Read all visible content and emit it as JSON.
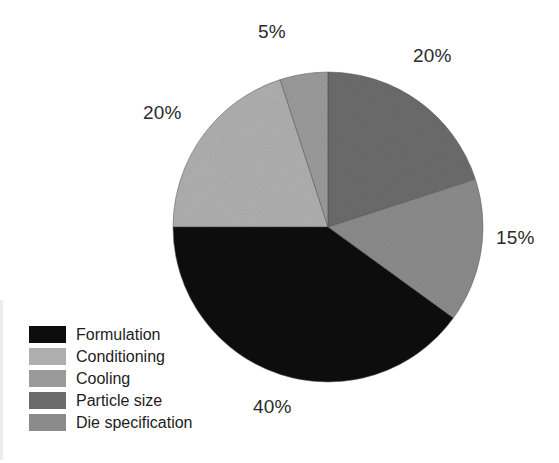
{
  "figure": {
    "background": "#ffffff",
    "label_color": "#2b2b2b",
    "legend_text_color": "#1d1d1d"
  },
  "chart_data": {
    "type": "pie",
    "title": "",
    "subtitle": "",
    "xlabel": "",
    "ylabel": "",
    "grid": false,
    "legend_position": "bottom-left",
    "units": "percent",
    "total": 100,
    "start_angle_deg": 0,
    "direction": "clockwise",
    "categories": [
      "Formulation",
      "Conditioning",
      "Cooling",
      "Particle size",
      "Die specification"
    ],
    "values": [
      40,
      20,
      5,
      20,
      15
    ],
    "data_labels": [
      "40%",
      "20%",
      "5%",
      "20%",
      "15%"
    ],
    "colors": [
      "#0d0d0d",
      "#aeaeae",
      "#9a9a9a",
      "#6b6b6b",
      "#8b8b8b"
    ],
    "slices": [
      {
        "label": "Particle size",
        "value": 20,
        "data_label": "20%",
        "color": "#6b6b6b",
        "start_angle_deg": 0,
        "end_angle_deg": 72,
        "label_position": "top-right"
      },
      {
        "label": "Die specification",
        "value": 15,
        "data_label": "15%",
        "color": "#8b8b8b",
        "start_angle_deg": 72,
        "end_angle_deg": 126,
        "label_position": "right"
      },
      {
        "label": "Formulation",
        "value": 40,
        "data_label": "40%",
        "color": "#0d0d0d",
        "start_angle_deg": 126,
        "end_angle_deg": 270,
        "label_position": "bottom"
      },
      {
        "label": "Conditioning",
        "value": 20,
        "data_label": "20%",
        "color": "#aeaeae",
        "start_angle_deg": 270,
        "end_angle_deg": 342,
        "label_position": "left"
      },
      {
        "label": "Cooling",
        "value": 5,
        "data_label": "5%",
        "color": "#9a9a9a",
        "start_angle_deg": 342,
        "end_angle_deg": 360,
        "label_position": "top"
      }
    ]
  },
  "callouts": {
    "top": "5%",
    "top_right": "20%",
    "left": "20%",
    "right": "15%",
    "bottom": "40%"
  },
  "legend": {
    "items": [
      {
        "label": "Formulation",
        "color": "#0d0d0d"
      },
      {
        "label": "Conditioning",
        "color": "#aeaeae"
      },
      {
        "label": "Cooling",
        "color": "#9a9a9a"
      },
      {
        "label": "Particle size",
        "color": "#6b6b6b"
      },
      {
        "label": "Die specification",
        "color": "#8b8b8b"
      }
    ]
  }
}
